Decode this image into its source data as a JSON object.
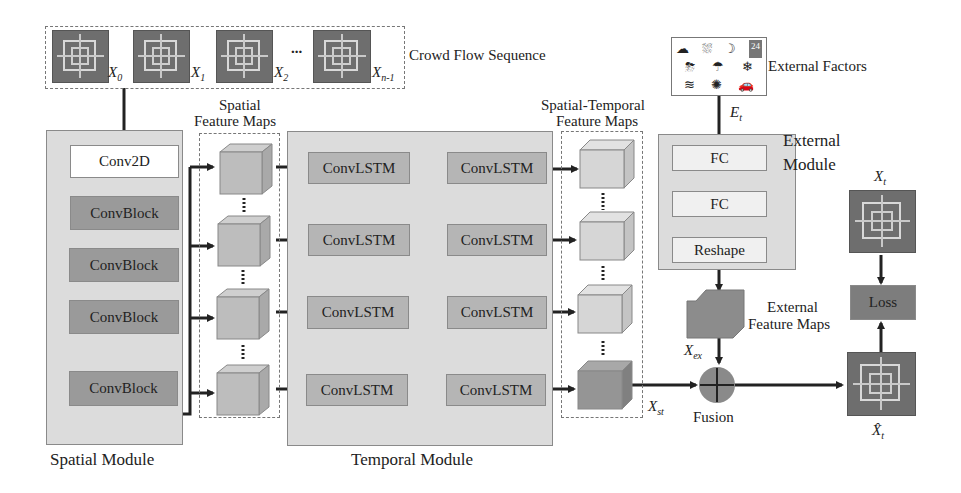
{
  "input": {
    "title": "Crowd Flow Sequence",
    "frames": [
      {
        "symbol": "X",
        "subscript": "0"
      },
      {
        "symbol": "X",
        "subscript": "1"
      },
      {
        "symbol": "X",
        "subscript": "2"
      },
      {
        "symbol": "X",
        "subscript": "n-1"
      }
    ],
    "ellipsis": "..."
  },
  "spatial_module": {
    "label": "Spatial Module",
    "blocks": [
      "Conv2D",
      "ConvBlock",
      "ConvBlock",
      "ConvBlock",
      "ConvBlock"
    ]
  },
  "spatial_feature_maps": {
    "label_line1": "Spatial",
    "label_line2": "Feature Maps"
  },
  "temporal_module": {
    "label": "Temporal Module",
    "cell_label": "ConvLSTM",
    "rows": 4,
    "cols": 2
  },
  "st_feature_maps": {
    "label_line1": "Spatial-Temporal",
    "label_line2": "Feature Maps",
    "output_symbol": "X",
    "output_subscript": "st"
  },
  "external": {
    "factors_label": "External Factors",
    "calendar_day": "24",
    "input_symbol": "E",
    "input_subscript": "t",
    "module_label_line1": "External",
    "module_label_line2": "Module",
    "blocks": [
      "FC",
      "FC",
      "Reshape"
    ],
    "feature_maps_line1": "External",
    "feature_maps_line2": "Feature Maps",
    "output_symbol": "X",
    "output_subscript": "ex"
  },
  "fusion": {
    "label": "Fusion",
    "symbol": "+"
  },
  "output": {
    "target_symbol": "X",
    "target_subscript": "t",
    "prediction_symbol": "X̂",
    "prediction_subscript": "t",
    "loss_label": "Loss"
  },
  "colors": {
    "module_bg": "#dcdcdc",
    "dark_block": "#9a9a9a",
    "mid_block": "#b5b5b5",
    "arrow": "#222222"
  }
}
